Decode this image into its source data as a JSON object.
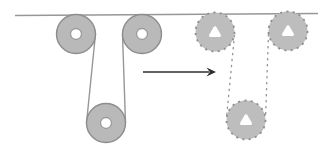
{
  "diagram": {
    "type": "pulley-diagram",
    "canvas": {
      "width": 328,
      "height": 152
    },
    "colors": {
      "background": "#ffffff",
      "rope": "#979797",
      "pulley_fill": "#b9b9b9",
      "pulley_stroke": "#8d8d8d",
      "ghost_fill": "#bdbdbd",
      "ghost_stroke": "#8f8f8f",
      "hole_fill": "#ffffff",
      "hole_ring": "#9a9a9a",
      "arrow": "#2e2e2e"
    },
    "elements": [
      {
        "type": "line",
        "name": "rope-horizontal",
        "x1": 15,
        "y1": 15.5,
        "x2": 318,
        "y2": 13.5,
        "color": "rope",
        "width": 1.4
      },
      {
        "type": "line",
        "name": "rope-left-segment-a",
        "x1": 95.5,
        "y1": 34,
        "x2": 86.5,
        "y2": 123,
        "color": "rope",
        "width": 1.4
      },
      {
        "type": "line",
        "name": "rope-left-segment-b",
        "x1": 122.5,
        "y1": 34,
        "x2": 125.5,
        "y2": 123,
        "color": "rope",
        "width": 1.4
      },
      {
        "type": "line",
        "name": "ghost-rope-segment-a",
        "x1": 234.5,
        "y1": 35,
        "x2": 226.5,
        "y2": 118,
        "dashed": true,
        "dash": "2.4 3.6",
        "color": "rope",
        "width": 1.3
      },
      {
        "type": "line",
        "name": "ghost-rope-segment-b",
        "x1": 268.5,
        "y1": 34,
        "x2": 265.5,
        "y2": 118,
        "dashed": true,
        "dash": "2.4 3.6",
        "color": "rope",
        "width": 1.3
      },
      {
        "type": "pulley",
        "name": "pulley-top-left",
        "cx": 76,
        "cy": 34,
        "r": 19.5,
        "hole_radius": 5.5
      },
      {
        "type": "pulley",
        "name": "pulley-top-right",
        "cx": 142,
        "cy": 34,
        "r": 19.5,
        "hole_radius": 5.5
      },
      {
        "type": "pulley",
        "name": "pulley-bottom",
        "cx": 106,
        "cy": 123,
        "r": 19.5,
        "hole_radius": 5.5
      },
      {
        "type": "pulley",
        "ghost": true,
        "name": "ghost-pulley-top-left",
        "cx": 215,
        "cy": 32,
        "r": 19.5,
        "hole_tri_halfwidth": 4.5,
        "hole_tri_up": 4.3,
        "hole_tri_down": 3.4
      },
      {
        "type": "pulley",
        "ghost": true,
        "name": "ghost-pulley-top-right",
        "cx": 288,
        "cy": 31,
        "r": 19.5,
        "hole_tri_halfwidth": 4.5,
        "hole_tri_up": 4.3,
        "hole_tri_down": 3.4
      },
      {
        "type": "pulley",
        "ghost": true,
        "name": "ghost-pulley-bottom",
        "cx": 246,
        "cy": 120,
        "r": 19.5,
        "hole_tri_halfwidth": 4.5,
        "hole_tri_up": 4.3,
        "hole_tri_down": 3.4
      },
      {
        "type": "arrow",
        "name": "transform-arrow",
        "x1": 143,
        "y1": 72,
        "x2": 216,
        "y2": 72
      }
    ]
  }
}
